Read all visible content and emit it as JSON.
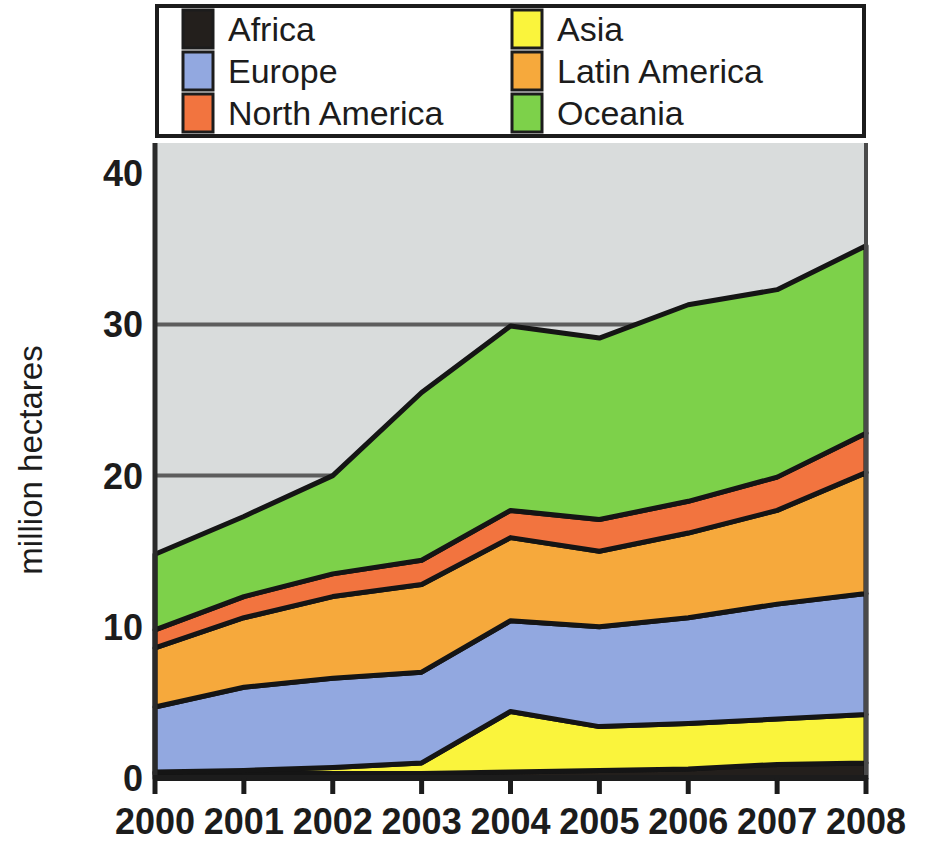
{
  "chart_data": {
    "type": "area",
    "stacked": true,
    "title": "",
    "xlabel": "",
    "ylabel": "million hectares",
    "categories": [
      "2000",
      "2001",
      "2002",
      "2003",
      "2004",
      "2005",
      "2006",
      "2007",
      "2008"
    ],
    "x": [
      2000,
      2001,
      2002,
      2003,
      2004,
      2005,
      2006,
      2007,
      2008
    ],
    "xlim": [
      2000,
      2008
    ],
    "ylim": [
      0,
      42
    ],
    "yticks": [
      0,
      10,
      20,
      30,
      40
    ],
    "ytick_labels": [
      "0",
      "10",
      "20",
      "30",
      "40"
    ],
    "gridlines": [
      20,
      30
    ],
    "grid": true,
    "legend_position": "top",
    "legend_columns": 2,
    "plot_background": "#d9dcdc",
    "series": [
      {
        "name": "Africa",
        "color": "#231f1c",
        "values": [
          0.3,
          0.3,
          0.3,
          0.3,
          0.4,
          0.5,
          0.6,
          0.9,
          1.0
        ]
      },
      {
        "name": "Asia",
        "color": "#faf43c",
        "values": [
          0.1,
          0.2,
          0.4,
          0.7,
          4.0,
          2.9,
          3.0,
          3.0,
          3.2
        ]
      },
      {
        "name": "Europe",
        "color": "#92a8e0",
        "values": [
          4.3,
          5.5,
          5.9,
          6.0,
          6.0,
          6.6,
          7.0,
          7.6,
          8.0
        ]
      },
      {
        "name": "Latin America",
        "color": "#f6a93c",
        "values": [
          3.9,
          4.6,
          5.4,
          5.8,
          5.5,
          5.0,
          5.6,
          6.2,
          8.0
        ]
      },
      {
        "name": "North America",
        "color": "#f2743f",
        "values": [
          1.2,
          1.4,
          1.5,
          1.6,
          1.8,
          2.1,
          2.1,
          2.2,
          2.6
        ]
      },
      {
        "name": "Oceania",
        "color": "#7dd14a",
        "values": [
          5.0,
          5.3,
          6.5,
          11.1,
          12.2,
          12.0,
          13.0,
          12.4,
          12.4
        ]
      }
    ],
    "totals": [
      14.8,
      17.3,
      20.0,
      25.5,
      29.9,
      29.1,
      31.3,
      32.3,
      35.2
    ]
  },
  "legend": {
    "entries": [
      {
        "label": "Africa",
        "color": "#231f1c"
      },
      {
        "label": "Asia",
        "color": "#faf43c"
      },
      {
        "label": "Europe",
        "color": "#92a8e0"
      },
      {
        "label": "Latin America",
        "color": "#f6a93c"
      },
      {
        "label": "North America",
        "color": "#f2743f"
      },
      {
        "label": "Oceania",
        "color": "#7dd14a"
      }
    ]
  },
  "axes": {
    "y_title": "million hectares",
    "y_tick_labels": [
      "40",
      "30",
      "20",
      "10",
      "0"
    ],
    "x_tick_labels": [
      "2000",
      "2001",
      "2002",
      "2003",
      "2004",
      "2005",
      "2006",
      "2007",
      "2008"
    ]
  }
}
